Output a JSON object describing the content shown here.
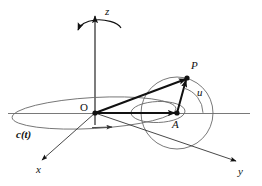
{
  "figure": {
    "background_color": "#ffffff",
    "stroke_color": "#111111",
    "thin_stroke_color": "#555555",
    "width": 262,
    "height": 186
  },
  "axes": {
    "z": {
      "label": "z",
      "x": 108,
      "y": 10,
      "style": "italic"
    },
    "x": {
      "label": "x",
      "x": 38,
      "y": 168,
      "style": "italic"
    },
    "y": {
      "label": "y",
      "x": 240,
      "y": 170,
      "style": "italic"
    }
  },
  "points": {
    "origin": {
      "label": "O",
      "x": 82,
      "y": 104,
      "style": "roman"
    },
    "center": {
      "label": "A",
      "x": 172,
      "y": 122,
      "style": "italic"
    },
    "particle": {
      "label": "P",
      "x": 192,
      "y": 62,
      "style": "italic"
    }
  },
  "angles": {
    "u": {
      "label": "u",
      "x": 198,
      "y": 92,
      "style": "italic"
    }
  },
  "curves": {
    "path": {
      "label": "c(t)",
      "x": 17,
      "y": 133,
      "style": "bold-italic"
    }
  },
  "elements": {
    "rotation_arc": "rotation-arrow-about-z-axis",
    "big_circle": "circle-of-rotation-about-A",
    "small_ellipse": "perspective-circle-through-A",
    "path_ellipse": "trajectory-ellipse-c-of-t",
    "vector_OP": "position-vector-O-to-P",
    "vector_OA": "position-vector-O-to-A",
    "vector_AP": "radius-vector-A-to-P",
    "horizontal_axis": "horizontal-reference-line"
  }
}
